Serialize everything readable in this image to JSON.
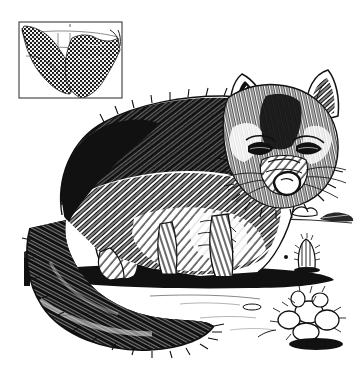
{
  "plate": {
    "width": 357,
    "height": 373,
    "medium": "pen-and-ink engraving / halftone line art",
    "background_color": "#ffffff",
    "ink_color": "#111111",
    "title": "Kit Fox",
    "caption": ""
  },
  "subject": {
    "name": "fox",
    "common_name": "Kit Fox",
    "pose": "standing, head lowered, facing viewer, bushy tail curled to the left",
    "parts": [
      {
        "name": "ear-left",
        "label": "Left Ear"
      },
      {
        "name": "ear-right",
        "label": "Right Ear"
      },
      {
        "name": "eye-left",
        "label": "Left Eye"
      },
      {
        "name": "eye-right",
        "label": "Right Eye"
      },
      {
        "name": "muzzle",
        "label": "Muzzle"
      },
      {
        "name": "nose",
        "label": "Nose"
      },
      {
        "name": "back",
        "label": "Back"
      },
      {
        "name": "foreleg",
        "label": "Foreleg"
      },
      {
        "name": "hindleg",
        "label": "Hind Leg"
      },
      {
        "name": "tail",
        "label": "Tail"
      }
    ]
  },
  "inset_map": {
    "title": "Range Map",
    "region": "United States",
    "border_color": "#333333",
    "shading": "halftone dot stipple",
    "bounds": {
      "x": 19,
      "y": 22,
      "width": 103,
      "height": 76
    },
    "shaded_areas": [
      {
        "name": "western-range",
        "label": "Western Range"
      },
      {
        "name": "eastern-range",
        "label": "Eastern Range"
      }
    ]
  },
  "background_scene": {
    "setting": "desert",
    "elements": [
      {
        "name": "horizon-line",
        "label": "Horizon"
      },
      {
        "name": "desert-tree",
        "label": "Desert Tree"
      },
      {
        "name": "distant-bush",
        "label": "Distant Bush"
      },
      {
        "name": "distant-rock",
        "label": "Distant Rock"
      },
      {
        "name": "barrel-cactus",
        "label": "Barrel Cactus"
      },
      {
        "name": "prickly-pear-cactus",
        "label": "Prickly Pear Cactus"
      },
      {
        "name": "ground-shadow",
        "label": "Ground Shadow"
      }
    ]
  }
}
